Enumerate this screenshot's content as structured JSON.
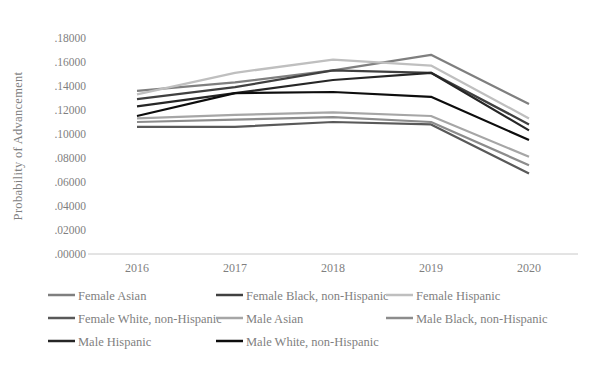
{
  "chart_data": {
    "type": "line",
    "title": "",
    "ylabel": "Probability of Advancement",
    "xlabel": "",
    "categories": [
      "2016",
      "2017",
      "2018",
      "2019",
      "2020"
    ],
    "y_ticks": [
      ".00000",
      ".02000",
      ".04000",
      ".06000",
      ".08000",
      ".10000",
      ".12000",
      ".14000",
      ".16000",
      ".18000"
    ],
    "ylim": [
      0,
      0.18
    ],
    "grid": false,
    "legend_position": "bottom",
    "axis_line_color": "#c8c8c8",
    "text_color": "#7f7f7f",
    "series": [
      {
        "name": "Female Asian",
        "color": "#7f7f7f",
        "values": [
          0.136,
          0.143,
          0.153,
          0.166,
          0.125
        ]
      },
      {
        "name": "Female Black, non-Hispanic",
        "color": "#404040",
        "values": [
          0.129,
          0.139,
          0.153,
          0.151,
          0.108
        ]
      },
      {
        "name": "Female Hispanic",
        "color": "#bfbfbf",
        "values": [
          0.133,
          0.151,
          0.162,
          0.157,
          0.113
        ]
      },
      {
        "name": "Female White, non-Hispanic",
        "color": "#595959",
        "values": [
          0.106,
          0.106,
          0.11,
          0.108,
          0.067
        ]
      },
      {
        "name": "Male Asian",
        "color": "#a6a6a6",
        "values": [
          0.113,
          0.116,
          0.118,
          0.115,
          0.081
        ]
      },
      {
        "name": "Male Black, non-Hispanic",
        "color": "#8c8c8c",
        "values": [
          0.11,
          0.112,
          0.114,
          0.11,
          0.074
        ]
      },
      {
        "name": "Male Hispanic",
        "color": "#262626",
        "values": [
          0.123,
          0.134,
          0.145,
          0.151,
          0.103
        ]
      },
      {
        "name": "Male White, non-Hispanic",
        "color": "#0d0d0d",
        "values": [
          0.115,
          0.134,
          0.135,
          0.131,
          0.095
        ]
      }
    ]
  }
}
